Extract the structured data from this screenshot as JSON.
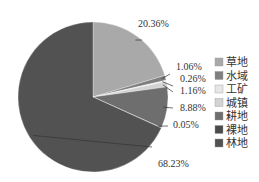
{
  "chart_data": {
    "type": "pie",
    "title": "",
    "start_angle_deg": 0,
    "direction": "clockwise",
    "categories": [
      "草地",
      "水域",
      "工矿",
      "城镇",
      "耕地",
      "裸地",
      "林地"
    ],
    "values": [
      20.36,
      1.06,
      0.26,
      1.16,
      8.88,
      0.05,
      68.23
    ],
    "labels": [
      "20.36%",
      "1.06%",
      "0.26%",
      "1.16%",
      "8.88%",
      "0.05%",
      "68.23%"
    ],
    "colors": [
      "#a9a9a9",
      "#7f7f7f",
      "#e6e6e6",
      "#d3d3d3",
      "#6e6e6e",
      "#4a4a4a",
      "#525252"
    ],
    "legend_position": "right",
    "unit": "%"
  }
}
